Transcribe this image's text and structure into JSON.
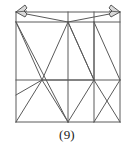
{
  "figure": {
    "caption": "(9)",
    "title": "",
    "stroke_color": "#5a5a5a",
    "support_color": "#4a4a4a",
    "background": "#ffffff",
    "line_width": 1,
    "supports": [
      {
        "name": "pin-support-top-left",
        "x": 16,
        "y": 12,
        "label": ""
      },
      {
        "name": "pin-support-top-right",
        "x": 120,
        "y": 12,
        "label": ""
      }
    ],
    "nodes": [
      {
        "id": "A",
        "x": 16,
        "y": 12,
        "label": ""
      },
      {
        "id": "B",
        "x": 68,
        "y": 12,
        "label": ""
      },
      {
        "id": "C",
        "x": 94,
        "y": 12,
        "label": ""
      },
      {
        "id": "D",
        "x": 120,
        "y": 12,
        "label": ""
      },
      {
        "id": "E",
        "x": 16,
        "y": 22,
        "label": ""
      },
      {
        "id": "F",
        "x": 68,
        "y": 22,
        "label": ""
      },
      {
        "id": "G",
        "x": 94,
        "y": 22,
        "label": ""
      },
      {
        "id": "H",
        "x": 120,
        "y": 22,
        "label": ""
      },
      {
        "id": "I",
        "x": 16,
        "y": 80,
        "label": ""
      },
      {
        "id": "J",
        "x": 42,
        "y": 80,
        "label": ""
      },
      {
        "id": "K",
        "x": 94,
        "y": 80,
        "label": ""
      },
      {
        "id": "L",
        "x": 120,
        "y": 80,
        "label": ""
      },
      {
        "id": "M",
        "x": 16,
        "y": 122,
        "label": ""
      },
      {
        "id": "N",
        "x": 68,
        "y": 122,
        "label": ""
      },
      {
        "id": "O",
        "x": 94,
        "y": 122,
        "label": ""
      },
      {
        "id": "P",
        "x": 120,
        "y": 122,
        "label": ""
      },
      {
        "id": "Q",
        "x": 16,
        "y": 95,
        "label": ""
      }
    ],
    "members": [
      {
        "name": "chord-top",
        "x1": 16,
        "y1": 12,
        "x2": 120,
        "y2": 12
      },
      {
        "name": "chord-upper",
        "x1": 16,
        "y1": 22,
        "x2": 120,
        "y2": 22
      },
      {
        "name": "chord-middle",
        "x1": 16,
        "y1": 80,
        "x2": 120,
        "y2": 80
      },
      {
        "name": "chord-bottom",
        "x1": 16,
        "y1": 122,
        "x2": 120,
        "y2": 122
      },
      {
        "name": "post-left",
        "x1": 16,
        "y1": 12,
        "x2": 16,
        "y2": 122
      },
      {
        "name": "post-right",
        "x1": 120,
        "y1": 12,
        "x2": 120,
        "y2": 122
      },
      {
        "name": "post-center",
        "x1": 68,
        "y1": 12,
        "x2": 68,
        "y2": 122
      },
      {
        "name": "post-inner-right",
        "x1": 94,
        "y1": 12,
        "x2": 94,
        "y2": 122
      },
      {
        "name": "diag-top-left-bay",
        "x1": 16,
        "y1": 12,
        "x2": 68,
        "y2": 22
      },
      {
        "name": "diag-top-right-bay",
        "x1": 120,
        "y1": 12,
        "x2": 68,
        "y2": 22
      },
      {
        "name": "diag-upper-left-long",
        "x1": 16,
        "y1": 22,
        "x2": 68,
        "y2": 122
      },
      {
        "name": "diag-upper-hub-left",
        "x1": 68,
        "y1": 22,
        "x2": 42,
        "y2": 80
      },
      {
        "name": "diag-upper-hub-right",
        "x1": 68,
        "y1": 22,
        "x2": 94,
        "y2": 80
      },
      {
        "name": "diag-hub-left-down",
        "x1": 42,
        "y1": 80,
        "x2": 68,
        "y2": 122
      },
      {
        "name": "diag-hub-left-up",
        "x1": 42,
        "y1": 80,
        "x2": 16,
        "y2": 22
      },
      {
        "name": "diag-hub-left-corner",
        "x1": 42,
        "y1": 80,
        "x2": 16,
        "y2": 122
      },
      {
        "name": "diag-hub-left-edge",
        "x1": 42,
        "y1": 80,
        "x2": 16,
        "y2": 95
      },
      {
        "name": "diag-hub-right-up",
        "x1": 94,
        "y1": 80,
        "x2": 68,
        "y2": 22
      },
      {
        "name": "diag-hub-right-top",
        "x1": 94,
        "y1": 80,
        "x2": 94,
        "y2": 22
      },
      {
        "name": "diag-hub-right-down",
        "x1": 94,
        "y1": 80,
        "x2": 68,
        "y2": 122
      },
      {
        "name": "diag-hub-right-corner",
        "x1": 94,
        "y1": 80,
        "x2": 120,
        "y2": 122
      },
      {
        "name": "diag-hub-right-left",
        "x1": 94,
        "y1": 80,
        "x2": 42,
        "y2": 80
      },
      {
        "name": "diag-right-bay-upper",
        "x1": 94,
        "y1": 22,
        "x2": 120,
        "y2": 80
      },
      {
        "name": "diag-right-bay-lower",
        "x1": 120,
        "y1": 80,
        "x2": 94,
        "y2": 122
      }
    ]
  }
}
